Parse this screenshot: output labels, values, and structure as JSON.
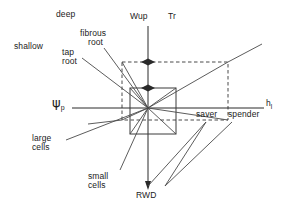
{
  "figure": {
    "type": "conceptual-axis-diagram",
    "background": "#ffffff",
    "line_color": "#3a3a3a",
    "text_color": "#1b1b1b"
  },
  "axes": {
    "vertical_top_labels": [
      {
        "id": "wup",
        "text": "Wup"
      },
      {
        "id": "tr",
        "text": "Tr"
      }
    ],
    "vertical_bottom_label": {
      "id": "rwd",
      "text": "RWD"
    },
    "horizontal_left_label": {
      "id": "psi-p",
      "base": "ψ",
      "sub": "p"
    },
    "horizontal_right_label": {
      "id": "h-l",
      "base": "h",
      "sub": "l"
    }
  },
  "labels": {
    "deep": "deep",
    "shallow": "shallow",
    "fibrous_root_line1": "fibrous",
    "fibrous_root_line2": "root",
    "tap_root_line1": "tap",
    "tap_root_line2": "root",
    "large_cells_line1": "large",
    "large_cells_line2": "cells",
    "small_cells_line1": "small",
    "small_cells_line2": "cells",
    "saver": "saver",
    "spender": "spender"
  },
  "geometry": {
    "center": {
      "x": 148,
      "y": 108
    },
    "inner_box": {
      "x": 130,
      "y": 88,
      "w": 46,
      "h": 46
    },
    "outer_dashed_box": {
      "x": 122,
      "y": 62,
      "w": 106,
      "h": 58
    },
    "vertical_axis": {
      "x": 148,
      "y1": 26,
      "y2": 188
    },
    "horizontal_axis": {
      "y": 108,
      "x1": 72,
      "x2": 268
    },
    "arrow_pairs_y": [
      62,
      88
    ]
  }
}
